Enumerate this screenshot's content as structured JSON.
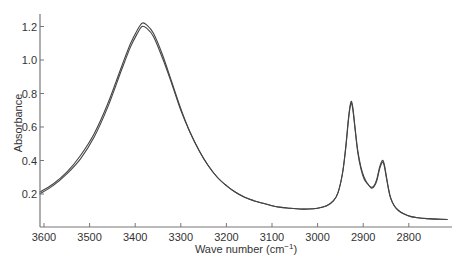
{
  "chart_data": {
    "type": "line",
    "title": "",
    "xlabel": "Wave number (cm⁻¹)",
    "xlabel_main": "Wave number (cm",
    "xlabel_sup": "−1",
    "xlabel_close": ")",
    "ylabel": "Absorbance",
    "xlim": [
      3610,
      2715
    ],
    "x_reversed": true,
    "ylim": [
      0.0,
      1.26
    ],
    "grid": false,
    "legend": null,
    "x_ticks": [
      3600,
      3500,
      3400,
      3300,
      3200,
      3100,
      3000,
      2900,
      2800
    ],
    "x_tick_labels": [
      "3600",
      "3500",
      "3400",
      "3300",
      "3200",
      "3100",
      "3000",
      "2900",
      "2800"
    ],
    "y_ticks": [
      0.2,
      0.4,
      0.6,
      0.8,
      1.0,
      1.2
    ],
    "y_tick_labels": [
      "0.2",
      "0.4",
      "0.6",
      "0.8",
      "1.0",
      "1.2"
    ],
    "series": [
      {
        "name": "spectrum-1",
        "color": "#444444",
        "x": [
          3610,
          3580,
          3550,
          3520,
          3490,
          3460,
          3430,
          3410,
          3395,
          3385,
          3375,
          3360,
          3340,
          3320,
          3300,
          3280,
          3260,
          3240,
          3220,
          3200,
          3180,
          3160,
          3140,
          3120,
          3100,
          3080,
          3060,
          3040,
          3020,
          3000,
          2980,
          2965,
          2955,
          2945,
          2938,
          2932,
          2927,
          2923,
          2918,
          2912,
          2905,
          2898,
          2890,
          2882,
          2876,
          2870,
          2864,
          2858,
          2854,
          2850,
          2845,
          2840,
          2832,
          2822,
          2810,
          2795,
          2780,
          2760,
          2740,
          2715
        ],
        "y": [
          0.21,
          0.26,
          0.33,
          0.43,
          0.56,
          0.74,
          0.96,
          1.1,
          1.18,
          1.22,
          1.21,
          1.16,
          1.03,
          0.87,
          0.71,
          0.57,
          0.46,
          0.37,
          0.3,
          0.25,
          0.21,
          0.18,
          0.16,
          0.145,
          0.13,
          0.12,
          0.115,
          0.11,
          0.11,
          0.115,
          0.13,
          0.16,
          0.21,
          0.33,
          0.49,
          0.66,
          0.75,
          0.72,
          0.6,
          0.46,
          0.36,
          0.3,
          0.26,
          0.24,
          0.25,
          0.29,
          0.36,
          0.4,
          0.38,
          0.32,
          0.24,
          0.18,
          0.13,
          0.1,
          0.08,
          0.065,
          0.058,
          0.053,
          0.05,
          0.048
        ]
      },
      {
        "name": "spectrum-2",
        "color": "#444444",
        "x": [
          3610,
          3580,
          3550,
          3520,
          3490,
          3460,
          3430,
          3410,
          3395,
          3385,
          3375,
          3360,
          3340,
          3320,
          3300,
          3280,
          3260,
          3240,
          3220,
          3200,
          3180,
          3160,
          3140,
          3120,
          3100,
          3080,
          3060,
          3040,
          3020,
          3000,
          2980,
          2965,
          2955,
          2945,
          2938,
          2932,
          2927,
          2923,
          2918,
          2912,
          2905,
          2898,
          2890,
          2882,
          2876,
          2870,
          2864,
          2858,
          2854,
          2850,
          2845,
          2840,
          2832,
          2822,
          2810,
          2795,
          2780,
          2760,
          2740,
          2715
        ],
        "y": [
          0.2,
          0.25,
          0.32,
          0.41,
          0.54,
          0.72,
          0.94,
          1.08,
          1.16,
          1.2,
          1.19,
          1.14,
          1.01,
          0.86,
          0.7,
          0.57,
          0.46,
          0.37,
          0.3,
          0.25,
          0.21,
          0.18,
          0.16,
          0.145,
          0.13,
          0.12,
          0.115,
          0.11,
          0.11,
          0.115,
          0.13,
          0.16,
          0.21,
          0.33,
          0.48,
          0.65,
          0.74,
          0.71,
          0.59,
          0.45,
          0.35,
          0.29,
          0.26,
          0.235,
          0.245,
          0.28,
          0.35,
          0.39,
          0.37,
          0.31,
          0.235,
          0.175,
          0.13,
          0.1,
          0.08,
          0.065,
          0.058,
          0.053,
          0.05,
          0.048
        ]
      }
    ],
    "annotations": []
  },
  "plot": {
    "axis_color": "#777777",
    "line_color": "#444444"
  }
}
